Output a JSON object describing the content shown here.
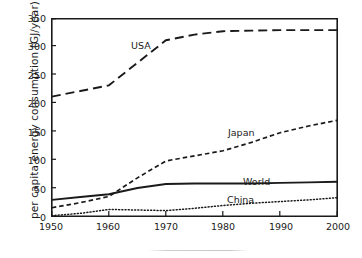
{
  "chart_data": {
    "type": "line",
    "title": "",
    "xlabel": "",
    "ylabel": "per capita energy consumption (GJ/year)",
    "xlim": [
      1950,
      2000
    ],
    "ylim": [
      0,
      350
    ],
    "xticks": [
      "1950",
      "1960",
      "1970",
      "1980",
      "1990",
      "2000"
    ],
    "yticks": [
      "0",
      "50",
      "100",
      "150",
      "200",
      "250",
      "300",
      "350"
    ],
    "grid": false,
    "legend_position": "inline-annotations",
    "x": [
      1950,
      1955,
      1960,
      1965,
      1970,
      1975,
      1980,
      1985,
      1990,
      1995,
      2000
    ],
    "series": [
      {
        "name": "USA",
        "style": "long-dashed",
        "values": [
          212,
          222,
          232,
          272,
          312,
          322,
          328,
          329,
          330,
          330,
          330
        ]
      },
      {
        "name": "Japan",
        "style": "short-dashed",
        "values": [
          15,
          24,
          35,
          68,
          98,
          107,
          116,
          131,
          148,
          160,
          170
        ]
      },
      {
        "name": "World",
        "style": "solid",
        "values": [
          29,
          34,
          39,
          50,
          57,
          58,
          58,
          58,
          59,
          60,
          61
        ]
      },
      {
        "name": "China",
        "style": "dotted",
        "values": [
          1,
          5,
          12,
          11,
          10,
          14,
          19,
          23,
          26,
          29,
          33
        ]
      }
    ],
    "annotations": [
      {
        "text": "USA",
        "x": 1965,
        "y": 290
      },
      {
        "text": "Japan",
        "x": 1982,
        "y": 143
      },
      {
        "text": "World",
        "x": 1985,
        "y": 57
      },
      {
        "text": "China",
        "x": 1981,
        "y": 26
      }
    ],
    "colors": {
      "axis": "#1a1a1a",
      "series": "#1a1a1a",
      "background": "#ffffff"
    }
  },
  "axis": {
    "ylabel": "per capita energy consumption (GJ/year)",
    "yticks": {
      "t0": "0",
      "t1": "50",
      "t2": "100",
      "t3": "150",
      "t4": "200",
      "t5": "250",
      "t6": "300",
      "t7": "350"
    },
    "xticks": {
      "t0": "1950",
      "t1": "1960",
      "t2": "1970",
      "t3": "1980",
      "t4": "1990",
      "t5": "2000"
    }
  },
  "annotations": {
    "usa": "USA",
    "japan": "Japan",
    "world": "World",
    "china": "China"
  }
}
